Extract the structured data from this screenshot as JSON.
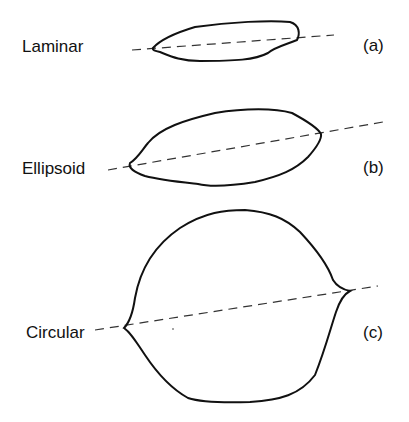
{
  "figure": {
    "rows": [
      {
        "label": "Laminar",
        "tag": "(a)"
      },
      {
        "label": "Ellipsoid",
        "tag": "(b)"
      },
      {
        "label": "Circular",
        "tag": "(c)"
      }
    ]
  },
  "colors": {
    "stroke": "#111111",
    "dash": "#333333",
    "background": "#ffffff"
  }
}
